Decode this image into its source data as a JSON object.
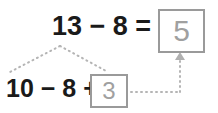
{
  "diagram": {
    "top_expression": "13 − 8 =",
    "total_value": "5",
    "bottom_expression": "10 − 8 +",
    "remainder_value": "3",
    "colors": {
      "text": "#1a1a1a",
      "box_border": "#9a9a9a",
      "box_text": "#a0a0a0",
      "connector": "#b5b5b5",
      "background": "#ffffff"
    },
    "connectors": [
      {
        "name": "branch-left",
        "style": "dotted",
        "from": "13",
        "to": "10"
      },
      {
        "name": "branch-right",
        "style": "dotted",
        "from": "13",
        "to": "remainder-box"
      },
      {
        "name": "result-arrow",
        "style": "dotted-with-arrowhead",
        "from": "remainder-box",
        "to": "total-box"
      }
    ]
  }
}
